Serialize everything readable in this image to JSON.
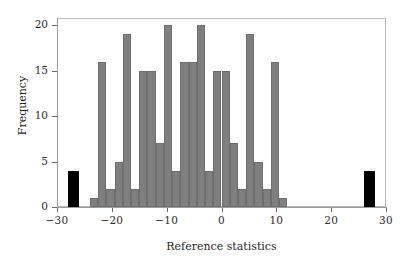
{
  "chart_data": {
    "type": "bar",
    "title": "",
    "subtitle": "",
    "xlabel": "Reference statistics",
    "ylabel": "Frequency",
    "xlim": [
      -30,
      30
    ],
    "ylim": [
      0,
      20.8
    ],
    "grid": false,
    "legend": null,
    "x_ticks": [
      -30,
      -20,
      -10,
      0,
      10,
      20,
      30
    ],
    "x_tick_labels": [
      "−30",
      "−20",
      "−10",
      "0",
      "10",
      "20",
      "30"
    ],
    "y_ticks": [
      0,
      5,
      10,
      15,
      20
    ],
    "y_tick_labels": [
      "0",
      "5",
      "10",
      "15",
      "20"
    ],
    "bin_width": 1.5,
    "series": [
      {
        "name": "Reference distribution",
        "color": "#7f7f7f",
        "bars": [
          {
            "center": -23.25,
            "left": -24.0,
            "width": 1.5,
            "value": 1
          },
          {
            "center": -21.75,
            "left": -22.5,
            "width": 1.5,
            "value": 16
          },
          {
            "center": -20.25,
            "left": -21.0,
            "width": 1.5,
            "value": 2
          },
          {
            "center": -18.75,
            "left": -19.5,
            "width": 1.5,
            "value": 5
          },
          {
            "center": -17.25,
            "left": -18.0,
            "width": 1.5,
            "value": 19
          },
          {
            "center": -15.75,
            "left": -16.5,
            "width": 1.5,
            "value": 2
          },
          {
            "center": -14.25,
            "left": -15.0,
            "width": 1.5,
            "value": 15
          },
          {
            "center": -12.75,
            "left": -13.5,
            "width": 1.5,
            "value": 15
          },
          {
            "center": -11.25,
            "left": -12.0,
            "width": 1.5,
            "value": 7
          },
          {
            "center": -9.75,
            "left": -10.5,
            "width": 1.5,
            "value": 20
          },
          {
            "center": -8.25,
            "left": -9.0,
            "width": 1.5,
            "value": 4
          },
          {
            "center": -6.75,
            "left": -7.5,
            "width": 1.5,
            "value": 16
          },
          {
            "center": -5.25,
            "left": -6.0,
            "width": 1.5,
            "value": 16
          },
          {
            "center": -3.75,
            "left": -4.5,
            "width": 1.5,
            "value": 20
          },
          {
            "center": -2.25,
            "left": -3.0,
            "width": 1.5,
            "value": 4
          },
          {
            "center": -0.75,
            "left": -1.5,
            "width": 1.5,
            "value": 15
          },
          {
            "center": 0.75,
            "left": 0.0,
            "width": 1.5,
            "value": 15
          },
          {
            "center": 2.25,
            "left": 1.5,
            "width": 1.5,
            "value": 7
          },
          {
            "center": 3.75,
            "left": 3.0,
            "width": 1.5,
            "value": 2
          },
          {
            "center": 5.25,
            "left": 4.5,
            "width": 1.5,
            "value": 19
          },
          {
            "center": 6.75,
            "left": 6.0,
            "width": 1.5,
            "value": 5
          },
          {
            "center": 8.25,
            "left": 7.5,
            "width": 1.5,
            "value": 2
          },
          {
            "center": 9.75,
            "left": 9.0,
            "width": 1.5,
            "value": 16
          },
          {
            "center": 11.25,
            "left": 10.5,
            "width": 1.5,
            "value": 1
          }
        ]
      },
      {
        "name": "Observed statistics",
        "color": "#000000",
        "bars": [
          {
            "center": -27.0,
            "left": -28.0,
            "width": 2.0,
            "value": 4
          },
          {
            "center": 27.0,
            "left": 26.0,
            "width": 2.0,
            "value": 4
          }
        ]
      }
    ]
  },
  "axis": {
    "x_label": "Reference statistics",
    "y_label": "Frequency"
  }
}
